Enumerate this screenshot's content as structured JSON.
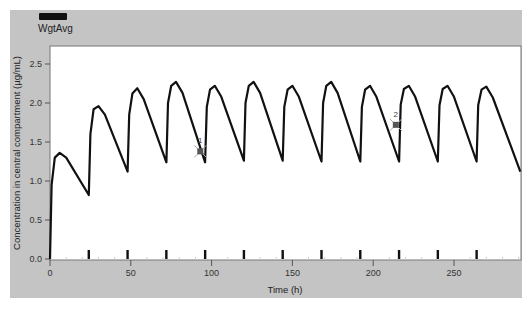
{
  "legend": {
    "entries": [
      {
        "label": "WgtAvg",
        "color": "#111111"
      }
    ]
  },
  "axes": {
    "xlabel": "Time (h)",
    "ylabel": "Concentration in central compartment (µg/mL)",
    "xticks": [
      "0",
      "50",
      "100",
      "150",
      "200",
      "250"
    ],
    "yticks": [
      "0.0",
      "0.5",
      "1.0",
      "1.5",
      "2.0",
      "2.5"
    ]
  },
  "annotations": [
    {
      "label": "1",
      "x": 93,
      "y": 1.38
    },
    {
      "label": "2",
      "x": 214,
      "y": 1.72
    }
  ],
  "chart_data": {
    "type": "line",
    "title": "",
    "xlabel": "Time (h)",
    "ylabel": "Concentration in central compartment (µg/mL)",
    "xlim": [
      0,
      291
    ],
    "ylim": [
      0,
      2.7
    ],
    "grid": false,
    "legend_position": "top-left",
    "dose_times": [
      24,
      48,
      72,
      96,
      120,
      144,
      168,
      192,
      216,
      240,
      264
    ],
    "series": [
      {
        "name": "WgtAvg",
        "color": "#111111",
        "x": [
          0,
          1,
          3,
          6,
          10,
          24,
          25,
          27,
          30,
          34,
          48,
          49,
          51,
          54,
          58,
          72,
          73,
          75,
          78,
          82,
          96,
          97,
          99,
          102,
          106,
          120,
          121,
          123,
          126,
          130,
          144,
          145,
          147,
          150,
          154,
          168,
          169,
          171,
          174,
          178,
          192,
          193,
          195,
          198,
          202,
          216,
          217,
          219,
          222,
          226,
          240,
          241,
          243,
          246,
          250,
          264,
          265,
          267,
          270,
          274,
          291
        ],
        "values": [
          0.0,
          0.95,
          1.3,
          1.36,
          1.3,
          0.82,
          1.6,
          1.92,
          1.96,
          1.85,
          1.12,
          1.85,
          2.12,
          2.19,
          2.05,
          1.24,
          2.0,
          2.22,
          2.27,
          2.13,
          1.24,
          1.95,
          2.17,
          2.22,
          2.08,
          1.26,
          2.0,
          2.22,
          2.27,
          2.13,
          1.26,
          1.95,
          2.17,
          2.22,
          2.08,
          1.25,
          2.0,
          2.22,
          2.27,
          2.13,
          1.25,
          1.95,
          2.17,
          2.22,
          2.08,
          1.25,
          1.98,
          2.18,
          2.22,
          2.08,
          1.25,
          1.97,
          2.18,
          2.22,
          2.08,
          1.25,
          1.97,
          2.17,
          2.21,
          2.07,
          1.12
        ]
      }
    ]
  }
}
